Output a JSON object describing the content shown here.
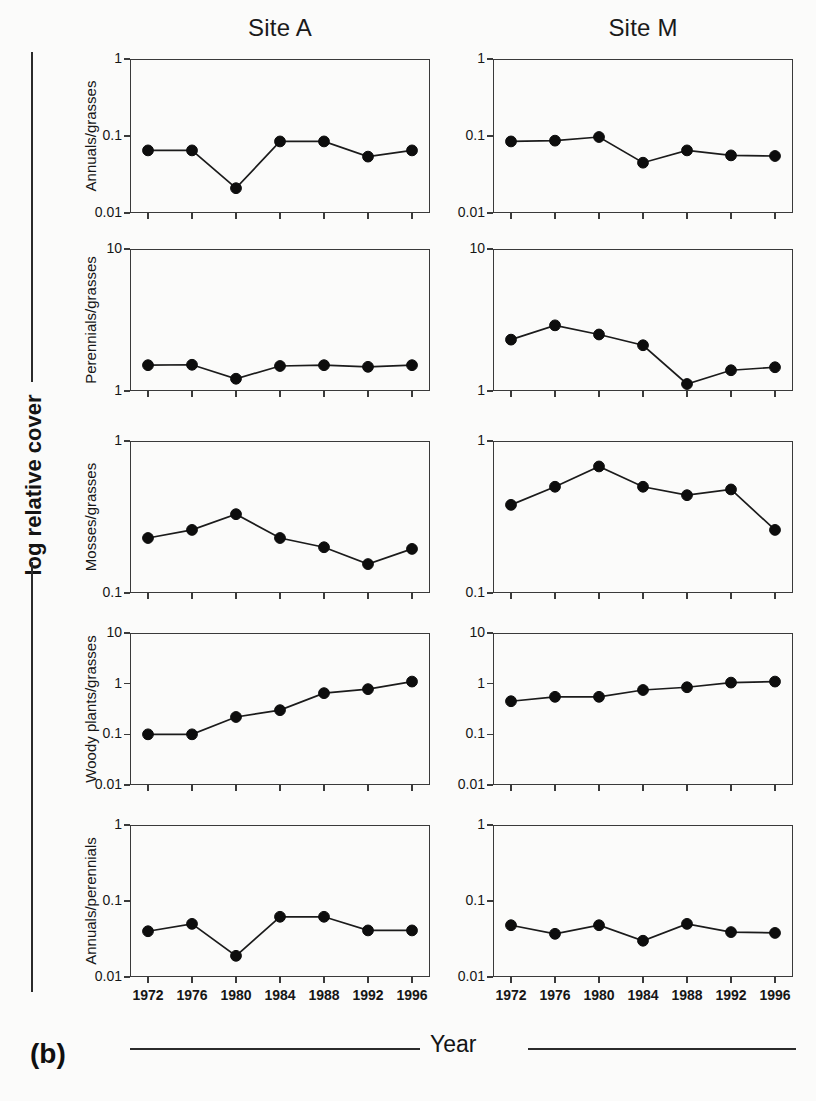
{
  "figure": {
    "panel_letter": "(b)",
    "y_axis_label": "log relative cover",
    "x_axis_label": "Year"
  },
  "columns": [
    {
      "title": "Site A"
    },
    {
      "title": "Site M"
    }
  ],
  "rows": [
    {
      "label": "Annuals/grasses"
    },
    {
      "label": "Perennials/grasses"
    },
    {
      "label": "Mosses/grasses"
    },
    {
      "label": "Woody plants/grasses"
    },
    {
      "label": "Annuals/perennials"
    }
  ],
  "x_tick_labels": [
    "1972",
    "1976",
    "1980",
    "1984",
    "1988",
    "1992",
    "1996"
  ],
  "y_tick_labels": {
    "r0": [
      "1",
      "0.1",
      "0.01"
    ],
    "r1": [
      "10",
      "1"
    ],
    "r2": [
      "1",
      "0.1"
    ],
    "r3": [
      "10",
      "1",
      "0.1",
      "0.01"
    ],
    "r4": [
      "1",
      "0.1",
      "0.01"
    ]
  },
  "colors": {
    "marker": "#0d0d0d",
    "line": "#1b1b1b",
    "axis": "#3a3a3a",
    "text": "#141414",
    "background": "#fbfbfa"
  },
  "chart_data": {
    "type": "line",
    "title": "",
    "xlabel": "Year",
    "ylabel": "log relative cover",
    "x": [
      1972,
      1976,
      1980,
      1984,
      1988,
      1992,
      1996
    ],
    "grid": false,
    "legend": "none",
    "yscale": "log",
    "panels": [
      {
        "row": "Annuals/grasses",
        "column": "Site A",
        "ylim": [
          0.01,
          1
        ],
        "yticks": [
          0.01,
          0.1,
          1
        ],
        "values": [
          0.065,
          0.065,
          0.021,
          0.085,
          0.085,
          0.054,
          0.065
        ]
      },
      {
        "row": "Annuals/grasses",
        "column": "Site M",
        "ylim": [
          0.01,
          1
        ],
        "yticks": [
          0.01,
          0.1,
          1
        ],
        "values": [
          0.085,
          0.087,
          0.097,
          0.045,
          0.065,
          0.056,
          0.055
        ]
      },
      {
        "row": "Perennials/grasses",
        "column": "Site A",
        "ylim": [
          1,
          10
        ],
        "yticks": [
          1,
          10
        ],
        "values": [
          1.52,
          1.53,
          1.22,
          1.5,
          1.52,
          1.48,
          1.52
        ]
      },
      {
        "row": "Perennials/grasses",
        "column": "Site M",
        "ylim": [
          1,
          10
        ],
        "yticks": [
          1,
          10
        ],
        "values": [
          2.3,
          2.9,
          2.5,
          2.1,
          1.12,
          1.4,
          1.47
        ]
      },
      {
        "row": "Mosses/grasses",
        "column": "Site A",
        "ylim": [
          0.1,
          1
        ],
        "yticks": [
          0.1,
          1
        ],
        "values": [
          0.23,
          0.26,
          0.33,
          0.23,
          0.2,
          0.155,
          0.195
        ]
      },
      {
        "row": "Mosses/grasses",
        "column": "Site M",
        "ylim": [
          0.1,
          1
        ],
        "yticks": [
          0.1,
          1
        ],
        "values": [
          0.38,
          0.5,
          0.68,
          0.5,
          0.44,
          0.48,
          0.26
        ]
      },
      {
        "row": "Woody plants/grasses",
        "column": "Site A",
        "ylim": [
          0.01,
          10
        ],
        "yticks": [
          0.01,
          0.1,
          1,
          10
        ],
        "values": [
          0.1,
          0.1,
          0.22,
          0.3,
          0.65,
          0.78,
          1.1
        ]
      },
      {
        "row": "Woody plants/grasses",
        "column": "Site M",
        "ylim": [
          0.01,
          10
        ],
        "yticks": [
          0.01,
          0.1,
          1,
          10
        ],
        "values": [
          0.45,
          0.55,
          0.55,
          0.75,
          0.85,
          1.05,
          1.1
        ]
      },
      {
        "row": "Annuals/perennials",
        "column": "Site A",
        "ylim": [
          0.01,
          1
        ],
        "yticks": [
          0.01,
          0.1,
          1
        ],
        "values": [
          0.04,
          0.05,
          0.019,
          0.062,
          0.062,
          0.041,
          0.041
        ]
      },
      {
        "row": "Annuals/perennials",
        "column": "Site M",
        "ylim": [
          0.01,
          1
        ],
        "yticks": [
          0.01,
          0.1,
          1
        ],
        "values": [
          0.048,
          0.037,
          0.048,
          0.03,
          0.05,
          0.039,
          0.038
        ]
      }
    ]
  }
}
